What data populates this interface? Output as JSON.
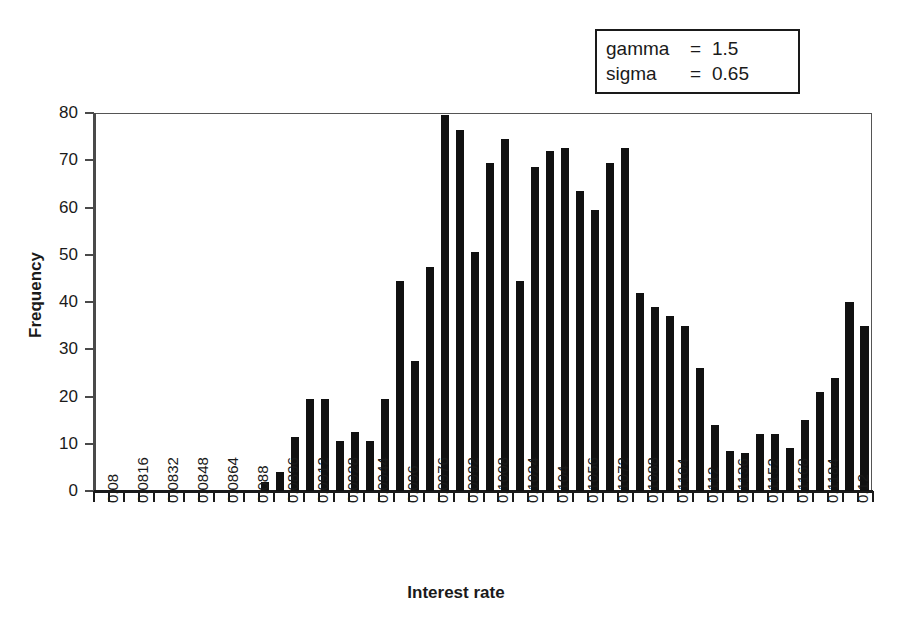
{
  "legend_box": {
    "rows": [
      {
        "name": "gamma",
        "eq": "=",
        "value": "1.5"
      },
      {
        "name": "sigma",
        "eq": "=",
        "value": "0.65"
      }
    ]
  },
  "chart_data": {
    "type": "bar",
    "title": "",
    "xlabel": "Interest rate",
    "ylabel": "Frequency",
    "ylim": [
      0,
      80
    ],
    "ytick_labels": [
      "0",
      "10",
      "20",
      "30",
      "40",
      "50",
      "60",
      "70",
      "80"
    ],
    "ytick_values": [
      0,
      10,
      20,
      30,
      40,
      50,
      60,
      70,
      80
    ],
    "grid": false,
    "legend_position": "top-right",
    "bin_width": 0.0008,
    "xlim": [
      0.08,
      0.12
    ],
    "xtick_labels": [
      "0.08",
      "0.0816",
      "0.0832",
      "0.0848",
      "0.0864",
      "0.088",
      "0.0896",
      "0.0912",
      "0.0928",
      "0.0944",
      "0.096",
      "0.0976",
      "0.0992",
      "0.1008",
      "0.1024",
      "0.104",
      "0.1056",
      "0.1072",
      "0.1088",
      "0.1104",
      "0.112",
      "0.1136",
      "0.1152",
      "0.1168",
      "0.1184",
      "0.12"
    ],
    "xtick_values": [
      0.08,
      0.0816,
      0.0832,
      0.0848,
      0.0864,
      0.088,
      0.0896,
      0.0912,
      0.0928,
      0.0944,
      0.096,
      0.0976,
      0.0992,
      0.1008,
      0.1024,
      0.104,
      0.1056,
      0.1072,
      0.1088,
      0.1104,
      0.112,
      0.1136,
      0.1152,
      0.1168,
      0.1184,
      0.12
    ],
    "categories": [
      0.08,
      0.0808,
      0.0816,
      0.0824,
      0.0832,
      0.084,
      0.0848,
      0.0856,
      0.0864,
      0.0872,
      0.088,
      0.0888,
      0.0896,
      0.0904,
      0.0912,
      0.092,
      0.0928,
      0.0936,
      0.0944,
      0.0952,
      0.096,
      0.0968,
      0.0976,
      0.0984,
      0.0992,
      0.1,
      0.1008,
      0.1016,
      0.1024,
      0.1032,
      0.104,
      0.1048,
      0.1056,
      0.1064,
      0.1072,
      0.108,
      0.1088,
      0.1096,
      0.1104,
      0.1112,
      0.112,
      0.1128,
      0.1136,
      0.1144,
      0.1152,
      0.116,
      0.1168,
      0.1176,
      0.1184,
      0.1192,
      0.12
    ],
    "values": [
      0,
      0,
      0,
      0,
      0,
      0,
      0,
      0,
      0,
      0,
      0,
      2,
      4,
      11.5,
      19.5,
      19.5,
      10.5,
      12.5,
      10.5,
      19.5,
      44.5,
      27.5,
      47.5,
      79.5,
      76.5,
      50.5,
      69.5,
      74.5,
      44.5,
      68.5,
      72,
      72.5,
      63.5,
      59.5,
      69.5,
      72.5,
      42,
      39,
      37,
      35,
      26,
      14,
      8.5,
      8,
      12,
      12,
      9,
      15,
      21,
      24,
      40
    ],
    "values_tail": [
      35
    ]
  }
}
